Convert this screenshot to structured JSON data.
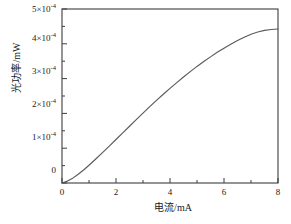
{
  "chart_data": {
    "type": "line",
    "title": "",
    "xlabel": "电流/mA",
    "ylabel": "光功率/mW",
    "xlim": [
      0,
      8
    ],
    "ylim": [
      0,
      0.0005
    ],
    "grid": false,
    "legend": null,
    "line_color": "#5a5a5a",
    "frame_color": "#3c3c3c",
    "background": "#ffffff",
    "x_ticks": [
      0,
      2,
      4,
      6,
      8
    ],
    "x_tick_labels": [
      "0",
      "2",
      "4",
      "6",
      "8"
    ],
    "x_minor_ticks": [
      1,
      3,
      5,
      7
    ],
    "y_ticks": [
      0,
      0.0001,
      0.0002,
      0.0003,
      0.0004,
      0.0005
    ],
    "y_tick_labels": [
      "0",
      "1×10-4",
      "2×10-4",
      "3×10-4",
      "4×10-4",
      "5×10-4"
    ],
    "y_tick_mantissa": [
      "0",
      "1",
      "2",
      "3",
      "4",
      "5"
    ],
    "y_tick_exponent": "-4",
    "y_minor_ticks": [
      5e-05,
      0.00015,
      0.00025,
      0.00035,
      0.00045
    ],
    "series": [
      {
        "name": "光功率",
        "x": [
          0.0,
          0.2,
          0.4,
          0.6,
          0.8,
          1.0,
          1.25,
          1.5,
          1.75,
          2.0,
          2.25,
          2.5,
          2.75,
          3.0,
          3.25,
          3.5,
          3.75,
          4.0,
          4.25,
          4.5,
          4.75,
          5.0,
          5.25,
          5.5,
          5.75,
          6.0,
          6.25,
          6.5,
          6.75,
          7.0,
          7.25,
          7.5,
          7.75,
          8.0
        ],
        "y": [
          0.0,
          5.5e-06,
          1.4e-05,
          2.5e-05,
          3.75e-05,
          5.1e-05,
          6.9e-05,
          8.75e-05,
          0.000106,
          0.000125,
          0.000144,
          0.000163,
          0.000182,
          0.000201,
          0.0002195,
          0.0002375,
          0.000255,
          0.000272,
          0.0002885,
          0.0003045,
          0.00032,
          0.000335,
          0.000349,
          0.0003625,
          0.0003755,
          0.0003875,
          0.000399,
          0.0004095,
          0.000419,
          0.0004275,
          0.000434,
          0.0004385,
          0.000441,
          0.0004425
        ]
      }
    ]
  },
  "figure": {
    "caption": ""
  }
}
